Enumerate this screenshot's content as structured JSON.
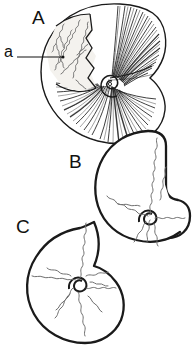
{
  "figure": {
    "caption_labels": {
      "panel_a_upper": "A",
      "panel_b": "B",
      "panel_c": "C",
      "annotation_suture": "a"
    },
    "colors": {
      "background": "#ffffff",
      "ink": "#111111",
      "outline": "#1a1a1a",
      "suture_line": "#8a8a8a",
      "shading": "#2b2b2b"
    },
    "panels": [
      {
        "id": "A",
        "label": "A",
        "description": "shaded ammonite shell with dense radial striations, exposed suture patch upper-left, spiral umbilicus at centre",
        "style": "engraved-hatched"
      },
      {
        "id": "B",
        "label": "B",
        "description": "outline ammonite shell with angular body chamber and frilled suture lines",
        "style": "line-outline"
      },
      {
        "id": "C",
        "label": "C",
        "description": "outline ammonite shell with radiating frilled suture lines around central spiral",
        "style": "line-outline"
      }
    ],
    "annotations": [
      {
        "id": "a",
        "label": "a",
        "target": "suture line on panel A",
        "leader": "horizontal line with dot terminus"
      }
    ]
  }
}
